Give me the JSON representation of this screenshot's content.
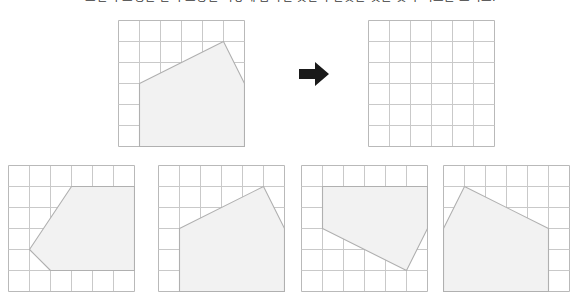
{
  "prompt": {
    "text": "오른쪽 도형은 왼쪽 도형을 어떻게 움직인 것인지 알맞은 것을 찾아 기호를 쓰시오."
  },
  "colors": {
    "grid_line": "#c9c9c9",
    "grid_border": "#b9b9b9",
    "shape_stroke": "#b0b0b0",
    "shape_fill": "#f2f2f2",
    "arrow": "#1a1a1a",
    "background": "#ffffff"
  },
  "arrow": {
    "icon": "arrow-right-icon",
    "direction": "right"
  },
  "grid": {
    "columns": 6,
    "rows": 6,
    "cell_size": 21
  },
  "panels": [
    {
      "id": "source-figure",
      "role": "question-source",
      "label": "original figure",
      "x": 118,
      "y": 20,
      "cell": 21,
      "cols": 6,
      "rows": 6,
      "shape": {
        "name": "pentagon",
        "vertices": [
          [
            1,
            3
          ],
          [
            5,
            1
          ],
          [
            6,
            3
          ],
          [
            6,
            6
          ],
          [
            1,
            6
          ]
        ]
      }
    },
    {
      "id": "target-figure",
      "role": "question-target",
      "label": "empty grid",
      "x": 368,
      "y": 20,
      "cell": 21,
      "cols": 6,
      "rows": 6,
      "shape": null
    },
    {
      "id": "option-1",
      "role": "answer-option",
      "label": "option 1",
      "x": 8,
      "y": 165,
      "cell": 21,
      "cols": 6,
      "rows": 6,
      "shape": {
        "name": "pentagon-rotated",
        "vertices": [
          [
            3,
            1
          ],
          [
            6,
            1
          ],
          [
            6,
            5
          ],
          [
            2,
            5
          ],
          [
            1,
            4
          ]
        ]
      }
    },
    {
      "id": "option-2",
      "role": "answer-option",
      "label": "option 2",
      "x": 158,
      "y": 165,
      "cell": 21,
      "cols": 6,
      "rows": 6,
      "shape": {
        "name": "pentagon-translated",
        "vertices": [
          [
            1,
            3
          ],
          [
            5,
            1
          ],
          [
            6,
            3
          ],
          [
            6,
            6
          ],
          [
            1,
            6
          ]
        ]
      }
    },
    {
      "id": "option-3",
      "role": "answer-option",
      "label": "option 3",
      "x": 301,
      "y": 165,
      "cell": 21,
      "cols": 6,
      "rows": 6,
      "shape": {
        "name": "pentagon-flipped-vertical",
        "vertices": [
          [
            1,
            1
          ],
          [
            6,
            1
          ],
          [
            6,
            3
          ],
          [
            5,
            5
          ],
          [
            1,
            3
          ]
        ]
      }
    },
    {
      "id": "option-4",
      "role": "answer-option",
      "label": "option 4",
      "x": 443,
      "y": 165,
      "cell": 21,
      "cols": 6,
      "rows": 6,
      "shape": {
        "name": "pentagon-mirrored-horizontal",
        "vertices": [
          [
            5,
            3
          ],
          [
            1,
            1
          ],
          [
            0,
            3
          ],
          [
            0,
            6
          ],
          [
            5,
            6
          ]
        ]
      }
    }
  ]
}
